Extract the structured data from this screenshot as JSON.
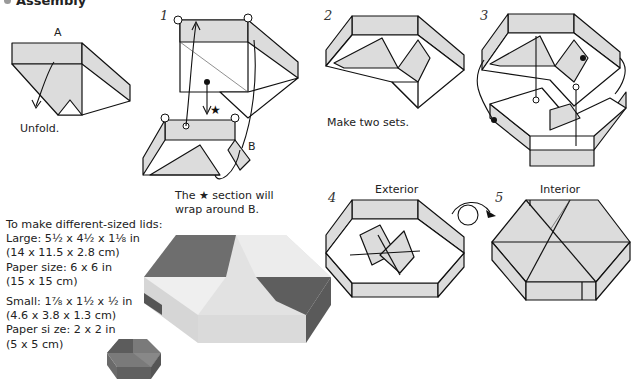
{
  "section": {
    "title": "Assembly",
    "bullet_color": "#9a9a9a"
  },
  "steps": [
    {
      "number": "",
      "label": "A",
      "caption": "Unfold."
    },
    {
      "number": "1",
      "label": "B",
      "caption_line1": "The ★ section will",
      "caption_line2": "wrap around B."
    },
    {
      "number": "2",
      "caption": "Make two sets."
    },
    {
      "number": "3"
    },
    {
      "number": "4",
      "title": "Exterior"
    },
    {
      "number": "5",
      "title": "Interior"
    }
  ],
  "lids": {
    "heading": "To make different-sized lids:",
    "large": {
      "dims_in": "Large: 5½ x 4½ x 1⅛ in",
      "dims_cm": "(14 x 11.5 x 2.8 cm)",
      "paper_in": "Paper size: 6 x 6 in",
      "paper_cm": "(15 x 15 cm)"
    },
    "small": {
      "dims_in": "Small: 1⅞ x 1½ x ½ in",
      "dims_cm": "(4.6 x 3.8 x 1.3 cm)",
      "paper_in": "Paper si ze: 2 x 2 in",
      "paper_cm": "(5 x 5 cm)"
    }
  },
  "colors": {
    "paper_fill": "#dcdcdc",
    "line": "#111111",
    "photo_light": "#e4e4e4",
    "photo_dark": "#6a6a6a"
  }
}
